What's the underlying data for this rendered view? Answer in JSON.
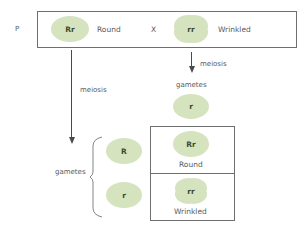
{
  "parental": {
    "generation_label": "P",
    "parent1": {
      "genotype": "Rr",
      "phenotype": "Round",
      "shape": "round"
    },
    "cross_symbol": "X",
    "parent2": {
      "genotype": "rr",
      "phenotype": "Wrinkled",
      "shape": "wrinkled"
    }
  },
  "left_branch": {
    "process_label": "meiosis",
    "result_label": "gametes",
    "gametes": [
      "R",
      "r"
    ]
  },
  "right_branch": {
    "process_label": "meiosis",
    "result_label": "gametes",
    "gamete": "r"
  },
  "offspring": [
    {
      "genotype": "Rr",
      "phenotype": "Round",
      "shape": "round"
    },
    {
      "genotype": "rr",
      "phenotype": "Wrinkled",
      "shape": "wrinkled"
    }
  ],
  "colors": {
    "cell_fill": "#d5e3bf",
    "line": "#4a4a4a",
    "border": "#6f6f6f"
  }
}
